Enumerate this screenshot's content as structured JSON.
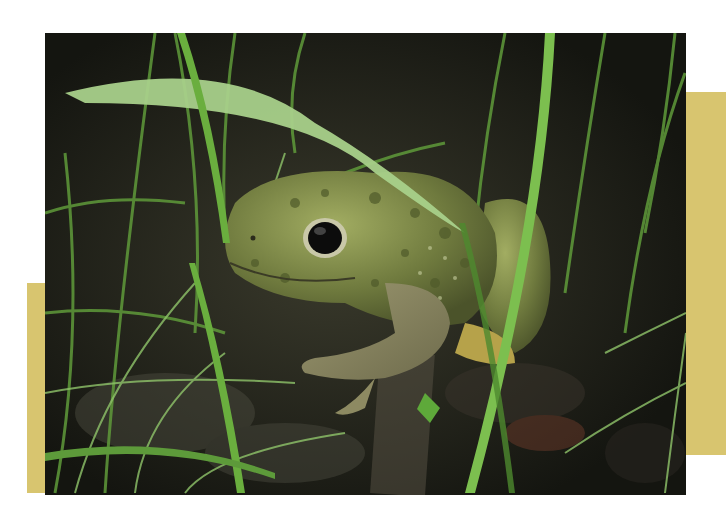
{
  "image": {
    "subject": "Frog",
    "description": "Green-and-brown mottled frog sitting among grass blades on dark soil at night",
    "alt": "Frog among grass blades"
  },
  "layout": {
    "background": "#ffffff",
    "accent_bar_color": "#d8c56f",
    "photo_frame": {
      "x": 45,
      "y": 33,
      "width": 641,
      "height": 462
    },
    "accent_bars": [
      {
        "name": "left",
        "x": 27,
        "y": 283,
        "width": 18,
        "height": 210
      },
      {
        "name": "right",
        "x": 686,
        "y": 92,
        "width": 40,
        "height": 363
      }
    ]
  },
  "colors": {
    "soil": "#1c1d16",
    "grass_light": "#8fc46a",
    "grass_dark": "#3f7a2a",
    "frog_body": "#7d8a4c",
    "frog_spots": "#4f5a2a",
    "frog_limb": "#8d8a62",
    "eye": "#0c0c0c"
  }
}
